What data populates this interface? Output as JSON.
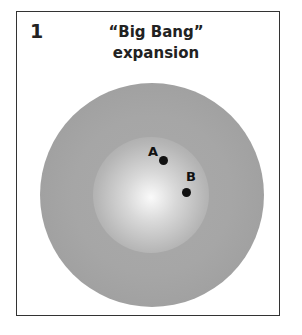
{
  "panel": {
    "number": "1",
    "title_line1": "“Big Bang”",
    "title_line2": "expansion"
  },
  "diagram": {
    "outer_sphere_color": "#a4a4a4",
    "inner_sphere_color": "#d0d0d0",
    "points": [
      {
        "label": "A"
      },
      {
        "label": "B"
      }
    ]
  }
}
